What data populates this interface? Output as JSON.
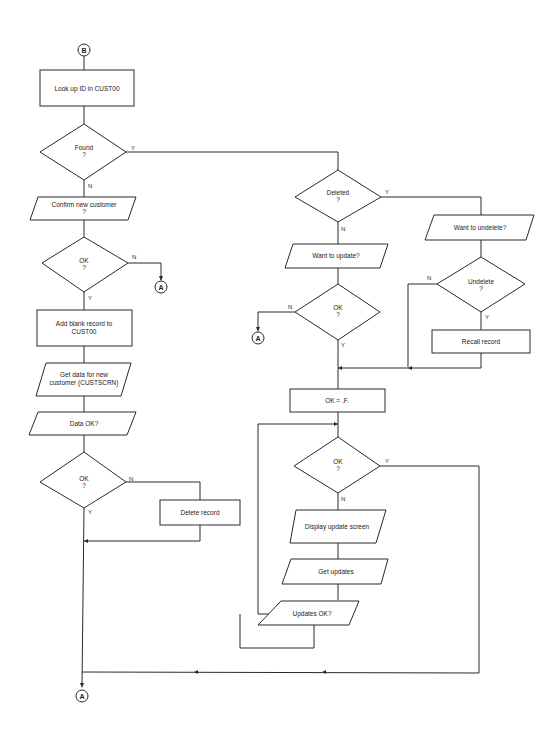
{
  "connectors": {
    "start": "B",
    "end": "A"
  },
  "nodes": {
    "lookup": "Look up ID in CUST00",
    "found": [
      "Found",
      "?"
    ],
    "confirm_new": [
      "Confirm new customer",
      "?"
    ],
    "ok1": [
      "OK",
      "?"
    ],
    "add_blank": [
      "Add blank record to",
      "CUST00"
    ],
    "get_data": [
      "Get data for new",
      "customer (CUSTSCRN)"
    ],
    "data_ok": "Data OK?",
    "ok2": [
      "OK",
      "?"
    ],
    "delete_record": "Delete record",
    "deleted": [
      "Deleted",
      "?"
    ],
    "want_update": "Want to update?",
    "ok3": [
      "OK",
      "?"
    ],
    "want_undelete": "Want to undelete?",
    "undelete": [
      "Undelete",
      "?"
    ],
    "recall_record": "Recall record",
    "ok_false": "OK = .F.",
    "ok4": [
      "OK",
      "?"
    ],
    "display_update": "Display update screen",
    "get_updates": "Get updates",
    "updates_ok": "Updates OK?"
  },
  "labels": {
    "yes": "Y",
    "no": "N"
  }
}
